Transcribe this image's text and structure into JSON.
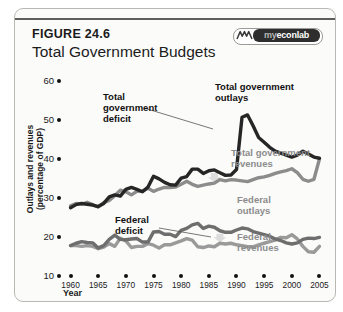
{
  "figure": {
    "label": "FIGURE 24.6",
    "title": "Total Government Budgets",
    "logo_icon": "mountain-w-icon",
    "logo_prefix": "my",
    "logo_main": "econlab"
  },
  "chart_data": {
    "type": "line",
    "title": "Total Government Budgets",
    "xlabel": "Year",
    "ylabel": "Outlays and revenues (percentage of GDP)",
    "xlim": [
      1959,
      2006
    ],
    "ylim": [
      10,
      60
    ],
    "xticks": [
      1960,
      1965,
      1970,
      1975,
      1980,
      1985,
      1990,
      1995,
      2000,
      2005
    ],
    "yticks": [
      10,
      20,
      30,
      40,
      50,
      60
    ],
    "grid": false,
    "legend": "inline-annotations",
    "x": [
      1960,
      1961,
      1962,
      1963,
      1964,
      1965,
      1966,
      1967,
      1968,
      1969,
      1970,
      1971,
      1972,
      1973,
      1974,
      1975,
      1976,
      1977,
      1978,
      1979,
      1980,
      1981,
      1982,
      1983,
      1984,
      1985,
      1986,
      1987,
      1988,
      1989,
      1990,
      1991,
      1992,
      1993,
      1994,
      1995,
      1996,
      1997,
      1998,
      1999,
      2000,
      2001,
      2002,
      2003,
      2004,
      2005
    ],
    "series": [
      {
        "name": "Total government outlays",
        "color": "#262626",
        "values": [
          27.5,
          28.3,
          28.6,
          28.4,
          28.2,
          27.8,
          28.6,
          30.3,
          30.8,
          30.5,
          32.2,
          32.7,
          32.2,
          31.6,
          32.8,
          35.6,
          34.9,
          34.0,
          33.4,
          33.3,
          35.1,
          35.5,
          37.4,
          37.4,
          36.3,
          37.0,
          37.2,
          36.5,
          35.8,
          35.9,
          37.3,
          50.7,
          51.3,
          48.5,
          45.5,
          44.3,
          43.0,
          42.0,
          41.5,
          41.0,
          40.5,
          41.0,
          42.0,
          41.3,
          40.5,
          40.2
        ]
      },
      {
        "name": "Total government revenues",
        "color": "#8c8c8c",
        "values": [
          28.0,
          28.6,
          28.4,
          28.9,
          28.3,
          27.7,
          28.8,
          29.4,
          30.6,
          32.0,
          31.6,
          30.8,
          31.7,
          31.8,
          32.5,
          31.7,
          32.3,
          32.7,
          32.7,
          32.8,
          33.5,
          34.3,
          33.5,
          33.0,
          33.3,
          33.6,
          33.8,
          34.7,
          34.4,
          34.7,
          34.6,
          34.4,
          34.2,
          34.7,
          35.2,
          35.4,
          35.8,
          36.3,
          36.7,
          37.0,
          37.5,
          36.5,
          34.8,
          34.3,
          34.8,
          40.0
        ]
      },
      {
        "name": "Federal outlays",
        "color": "#6e6e6e",
        "values": [
          17.8,
          18.4,
          18.8,
          18.6,
          18.5,
          17.2,
          17.8,
          19.4,
          20.5,
          19.4,
          19.3,
          19.5,
          19.6,
          18.7,
          18.7,
          21.3,
          21.4,
          20.7,
          20.7,
          20.1,
          21.7,
          22.2,
          23.1,
          23.5,
          22.2,
          22.8,
          22.5,
          21.6,
          21.2,
          21.2,
          21.8,
          22.3,
          22.1,
          21.4,
          21.0,
          20.6,
          20.2,
          19.5,
          19.1,
          18.5,
          18.2,
          18.5,
          19.4,
          19.7,
          19.6,
          19.9
        ]
      },
      {
        "name": "Federal revenues",
        "color": "#9a9a9a",
        "values": [
          17.8,
          17.8,
          17.6,
          17.8,
          17.6,
          17.0,
          17.4,
          18.3,
          17.6,
          19.7,
          19.0,
          17.3,
          17.6,
          17.6,
          18.3,
          17.9,
          17.2,
          18.0,
          18.0,
          18.5,
          19.0,
          19.6,
          19.2,
          17.5,
          17.3,
          17.7,
          17.5,
          18.4,
          18.2,
          18.4,
          18.0,
          17.8,
          17.5,
          17.5,
          18.0,
          18.4,
          18.8,
          19.2,
          19.9,
          19.8,
          20.6,
          19.5,
          17.6,
          16.2,
          16.1,
          17.6
        ]
      }
    ],
    "annotations": [
      {
        "name": "total-government-deficit",
        "text": "Total\ngovernment\ndeficit",
        "style": "dark"
      },
      {
        "name": "total-government-outlays",
        "text": "Total government\noutlays",
        "style": "dark"
      },
      {
        "name": "total-government-revenues",
        "text": "Total government\nrevenues",
        "style": "gray"
      },
      {
        "name": "federal-deficit",
        "text": "Federal\ndeficit",
        "style": "dark"
      },
      {
        "name": "federal-outlays",
        "text": "Federal\noutlays",
        "style": "gray"
      },
      {
        "name": "federal-revenues",
        "text": "Federal\nrevenues",
        "style": "gray"
      }
    ]
  }
}
